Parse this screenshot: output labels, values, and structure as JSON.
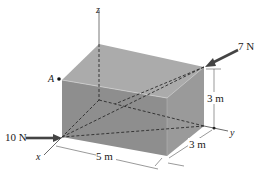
{
  "figure": {
    "type": "3d-box-force-diagram",
    "axes": {
      "x": "x",
      "y": "y",
      "z": "z"
    },
    "point_label": "A",
    "forces": [
      {
        "label": "7 N",
        "applied_at": "top-right-back corner",
        "direction": "pointing down-left toward box"
      },
      {
        "label": "10 N",
        "applied_at": "bottom-front-left corner on x-axis",
        "direction": "pointing right into box"
      }
    ],
    "dimensions": {
      "length": "5 m",
      "width": "3 m",
      "height": "3 m"
    },
    "colors": {
      "box_top": "#a9a9a9",
      "box_front": "#8f8f8f",
      "box_right": "#9c9c9c",
      "arrow": "#4a4a4a",
      "dashed": "#333333"
    }
  }
}
